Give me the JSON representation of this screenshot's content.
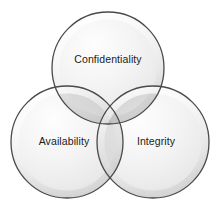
{
  "diagram": {
    "type": "venn",
    "background_color": "#ffffff",
    "stroke_color": "#4a4a4a",
    "fill_color": "#e9e9e9",
    "label_color": "#1b1b1b",
    "circles": [
      {
        "id": "confidentiality",
        "label": "Confidentiality",
        "position": "top",
        "cx": 108,
        "cy": 68,
        "r": 56,
        "label_x": 108,
        "label_y": 60
      },
      {
        "id": "availability",
        "label": "Availability",
        "position": "bottom-left",
        "cx": 67,
        "cy": 142,
        "r": 56,
        "label_x": 64,
        "label_y": 142
      },
      {
        "id": "integrity",
        "label": "Integrity",
        "position": "bottom-right",
        "cx": 153,
        "cy": 142,
        "r": 56,
        "label_x": 156,
        "label_y": 142
      }
    ]
  }
}
